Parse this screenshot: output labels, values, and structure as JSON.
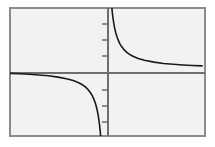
{
  "figure": {
    "kind": "math-function-plot",
    "caption": "",
    "background_color": "#ffffff",
    "plot_area": {
      "fill_color": "#f2f2f0",
      "border_color": "#8c8c8c",
      "border_width": 2,
      "left": 9,
      "top": 7,
      "right": 205,
      "bottom": 136
    },
    "axes": {
      "color": "#6e6e6e",
      "width": 2,
      "origin_x_px": 108,
      "origin_y_px": 73,
      "x_axis_label": "",
      "y_axis_label": "",
      "tick_color": "#6e6e6e",
      "tick_length_px": 6,
      "tick_side": "left",
      "tick_labels": []
    },
    "curve": {
      "color": "#1a1a1a",
      "width": 1.6,
      "equation_label": "y = 1/x",
      "branches": [
        {
          "name": "quadrant-I-branch",
          "quadrant": "I",
          "description": "decreasing branch, asymptotic to positive y-axis and positive x-axis"
        },
        {
          "name": "quadrant-III-branch",
          "quadrant": "III",
          "description": "decreasing branch, asymptotic to negative x-axis and negative y-axis"
        }
      ]
    }
  },
  "chart_data": {
    "type": "line",
    "title": "",
    "subtitle": "",
    "xlabel": "",
    "ylabel": "",
    "grid": false,
    "legend": false,
    "legend_position": "none",
    "xlim": [
      -5.0,
      5.1
    ],
    "ylim": [
      -3.5,
      3.3
    ],
    "xticks": [],
    "yticks": [
      -3,
      -2,
      -1,
      1,
      2,
      3
    ],
    "xtick_labels": [],
    "ytick_labels": [],
    "annotations": [],
    "series": [
      {
        "name": "y = 1/x (branch x > 0)",
        "color": "#1a1a1a",
        "x": [
          0.31,
          0.33,
          0.36,
          0.4,
          0.45,
          0.5,
          0.56,
          0.63,
          0.71,
          0.8,
          0.91,
          1.0,
          1.11,
          1.25,
          1.43,
          1.67,
          2.0,
          2.5,
          3.0,
          3.5,
          4.0,
          4.5,
          5.0
        ],
        "y": [
          3.23,
          3.03,
          2.78,
          2.5,
          2.22,
          2.0,
          1.79,
          1.59,
          1.41,
          1.25,
          1.1,
          1.0,
          0.9,
          0.8,
          0.7,
          0.6,
          0.5,
          0.4,
          0.33,
          0.29,
          0.25,
          0.22,
          0.2
        ]
      },
      {
        "name": "y = 1/x (branch x < 0)",
        "color": "#1a1a1a",
        "x": [
          -5.0,
          -4.5,
          -4.0,
          -3.5,
          -3.0,
          -2.5,
          -2.0,
          -1.67,
          -1.43,
          -1.25,
          -1.11,
          -1.0,
          -0.91,
          -0.8,
          -0.71,
          -0.63,
          -0.56,
          -0.5,
          -0.45,
          -0.4,
          -0.36,
          -0.33,
          -0.3,
          -0.29
        ],
        "y": [
          -0.2,
          -0.22,
          -0.25,
          -0.29,
          -0.33,
          -0.4,
          -0.5,
          -0.6,
          -0.7,
          -0.8,
          -0.9,
          -1.0,
          -1.1,
          -1.25,
          -1.41,
          -1.59,
          -1.79,
          -2.0,
          -2.22,
          -2.5,
          -2.78,
          -3.03,
          -3.33,
          -3.45
        ]
      }
    ]
  }
}
